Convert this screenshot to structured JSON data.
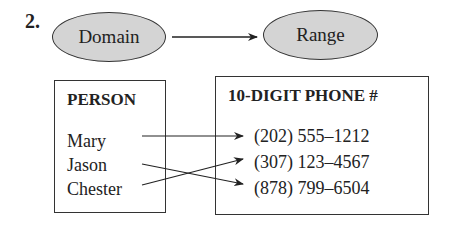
{
  "problem_number": "2.",
  "header": {
    "domain_label": "Domain",
    "range_label": "Range"
  },
  "domain_box": {
    "title": "PERSON",
    "items": [
      "Mary",
      "Jason",
      "Chester"
    ]
  },
  "range_box": {
    "title": "10-DIGIT PHONE #",
    "items": [
      "(202) 555–1212",
      "(307) 123–4567",
      "(878) 799–6504"
    ]
  },
  "mapping": [
    {
      "from": "Mary",
      "to": "(202) 555–1212"
    },
    {
      "from": "Jason",
      "to": "(878) 799–6504"
    },
    {
      "from": "Chester",
      "to": "(307) 123–4567"
    }
  ],
  "colors": {
    "ellipse_fill": "#d4d4d4",
    "stroke": "#333333"
  }
}
